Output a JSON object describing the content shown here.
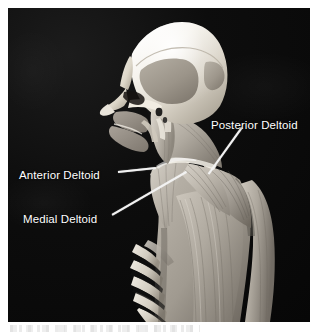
{
  "figure": {
    "view": "lateral-posterior view of head, neck and shoulder",
    "background_color": "#0a0a0a",
    "label_color": "#ffffff",
    "leader_color": "#f2f2f2",
    "bone_color": "#e8e4dc",
    "muscle_color": "#b9b4ab"
  },
  "labels": [
    {
      "id": "posterior-deltoid",
      "text": "Posterior Deltoid",
      "x": 203,
      "y": 112
    },
    {
      "id": "anterior-deltoid",
      "text": "Anterior Deltoid",
      "x": 11,
      "y": 162
    },
    {
      "id": "medial-deltoid",
      "text": "Medial Deltoid",
      "x": 15,
      "y": 206
    }
  ],
  "leaders": [
    {
      "id": "leader-posterior-deltoid",
      "from_x": 242,
      "from_y": 127,
      "to_x": 209,
      "to_y": 173
    },
    {
      "id": "leader-anterior-deltoid",
      "from_x": 118,
      "from_y": 171,
      "to_x": 156,
      "to_y": 167
    },
    {
      "id": "leader-medial-deltoid",
      "from_x": 112,
      "from_y": 214,
      "to_x": 186,
      "to_y": 171
    }
  ]
}
